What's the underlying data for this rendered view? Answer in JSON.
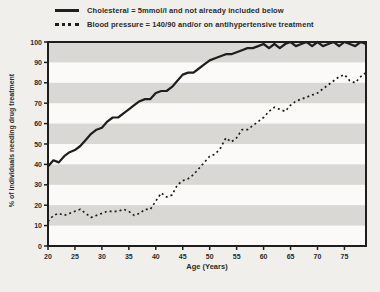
{
  "page": {
    "background": "#f1efec"
  },
  "legend": {
    "items": [
      {
        "label": "Cholesteral = 5mmol/l and not already included below",
        "style": "solid"
      },
      {
        "label": "Blood pressure = 140/90 and/or on antihypertensive treatment",
        "style": "dotted"
      }
    ]
  },
  "chart_data": {
    "type": "line",
    "title": "",
    "xlabel": "Age (Years)",
    "ylabel": "% of individuals needing drug treatment",
    "xlim": [
      20,
      79
    ],
    "ylim": [
      0,
      100
    ],
    "x_ticks": [
      20,
      25,
      30,
      35,
      40,
      45,
      50,
      55,
      60,
      65,
      70,
      75
    ],
    "y_ticks": [
      0,
      10,
      20,
      30,
      40,
      50,
      60,
      70,
      80,
      90,
      100
    ],
    "grid": "horizontal-stripe-bands",
    "legend_position": "top-left",
    "x": [
      20,
      21,
      22,
      23,
      24,
      25,
      26,
      27,
      28,
      29,
      30,
      31,
      32,
      33,
      34,
      35,
      36,
      37,
      38,
      39,
      40,
      41,
      42,
      43,
      44,
      45,
      46,
      47,
      48,
      49,
      50,
      51,
      52,
      53,
      54,
      55,
      56,
      57,
      58,
      59,
      60,
      61,
      62,
      63,
      64,
      65,
      66,
      67,
      68,
      69,
      70,
      71,
      72,
      73,
      74,
      75,
      76,
      77,
      78,
      79
    ],
    "series": [
      {
        "name": "Cholesteral = 5mmol/l and not already included below",
        "line": "solid",
        "values": [
          39,
          42,
          41,
          44,
          46,
          47,
          49,
          52,
          55,
          57,
          58,
          61,
          63,
          63,
          65,
          67,
          69,
          71,
          72,
          72,
          75,
          76,
          76,
          78,
          81,
          84,
          85,
          85,
          87,
          89,
          91,
          92,
          93,
          94,
          94,
          95,
          96,
          97,
          97,
          98,
          99,
          97,
          99,
          97,
          99,
          100,
          98,
          99,
          100,
          98,
          100,
          98,
          99,
          100,
          98,
          100,
          99,
          98,
          100,
          99
        ]
      },
      {
        "name": "Blood pressure = 140/90 and/or on antihypertensive treatment",
        "line": "dotted",
        "values": [
          12,
          15,
          16,
          15,
          16,
          17,
          18,
          16,
          14,
          15,
          16,
          17,
          17,
          17,
          18,
          17,
          15,
          16,
          18,
          18,
          22,
          26,
          24,
          25,
          30,
          32,
          33,
          35,
          38,
          41,
          44,
          45,
          48,
          53,
          51,
          53,
          57,
          57,
          59,
          61,
          63,
          66,
          68,
          67,
          66,
          69,
          71,
          72,
          73,
          74,
          75,
          77,
          79,
          81,
          83,
          84,
          81,
          80,
          83,
          85
        ]
      }
    ],
    "colors": {
      "line": "#1e1e1e",
      "stripe_band": "#d9d8d5",
      "plot_background": "#fbfaf8",
      "frame": "#1e1e1e",
      "tick_text": "#2a2a2a"
    }
  }
}
